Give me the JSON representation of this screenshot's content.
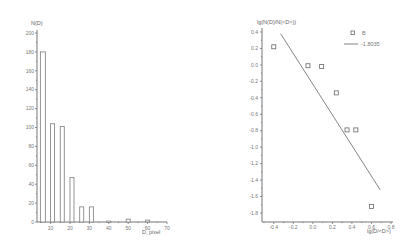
{
  "chart_data": [
    {
      "type": "bar",
      "title": "",
      "ylabel": "N(D)",
      "xlabel": "D, pixel",
      "categories": [
        5,
        10,
        15,
        20,
        25,
        30,
        40,
        50,
        60
      ],
      "values": [
        180,
        104,
        101,
        47,
        16,
        16,
        1,
        3,
        2
      ],
      "xlim": [
        3,
        70
      ],
      "ylim": [
        0,
        200
      ],
      "xticks": [
        10,
        20,
        30,
        40,
        50,
        60,
        70
      ],
      "yticks": [
        0,
        20,
        40,
        60,
        80,
        100,
        120,
        140,
        160,
        180,
        200
      ],
      "grid": false,
      "legend": null
    },
    {
      "type": "scatter",
      "title": "",
      "ylabel": "lg(N(D)/N(<D>))",
      "xlabel": "lg(D/<D>)",
      "series": [
        {
          "name": "B",
          "marker": "open-square",
          "x": [
            -0.4,
            -0.05,
            0.09,
            0.24,
            0.35,
            0.44,
            0.6
          ],
          "y": [
            0.22,
            -0.01,
            -0.02,
            -0.34,
            -0.79,
            -0.79,
            -1.72
          ]
        },
        {
          "name": "-1.8035",
          "type": "line",
          "x": [
            -0.33,
            0.69
          ],
          "y": [
            0.38,
            -1.52
          ]
        }
      ],
      "xlim": [
        -0.5,
        0.8
      ],
      "ylim": [
        -1.9,
        0.4
      ],
      "xticks": [
        -0.4,
        -0.2,
        0.0,
        0.2,
        0.4,
        0.6,
        0.8
      ],
      "yticks": [
        0.4,
        0.2,
        0.0,
        -0.2,
        -0.4,
        -0.6,
        -0.8,
        -1.0,
        -1.2,
        -1.4,
        -1.6,
        -1.8
      ],
      "grid": false,
      "legend": {
        "position": "upper right",
        "entries": [
          "B",
          "-1.8035"
        ]
      }
    }
  ],
  "left": {
    "ylabel": "N(D)",
    "xlabel": "D, pixel",
    "yticks": [
      "0",
      "20",
      "40",
      "60",
      "80",
      "100",
      "120",
      "140",
      "160",
      "180",
      "200"
    ],
    "xticks": [
      "10",
      "20",
      "30",
      "40",
      "50",
      "60",
      "70"
    ]
  },
  "right": {
    "ylabel": "lg(N(D)/N(<D>))",
    "xlabel": "lg(D/<D>)",
    "yticks": [
      "0.4",
      "0.2",
      "0.0",
      "-0.2",
      "-0.4",
      "-0.6",
      "-0.8",
      "-1.0",
      "-1.2",
      "-1.4",
      "-1.6",
      "-1.8"
    ],
    "xticks": [
      "-0.4",
      "-0.2",
      "0.0",
      "0.2",
      "0.4",
      "0.6",
      "0.8"
    ],
    "legend_points": "B",
    "legend_line": "-1.8035"
  }
}
